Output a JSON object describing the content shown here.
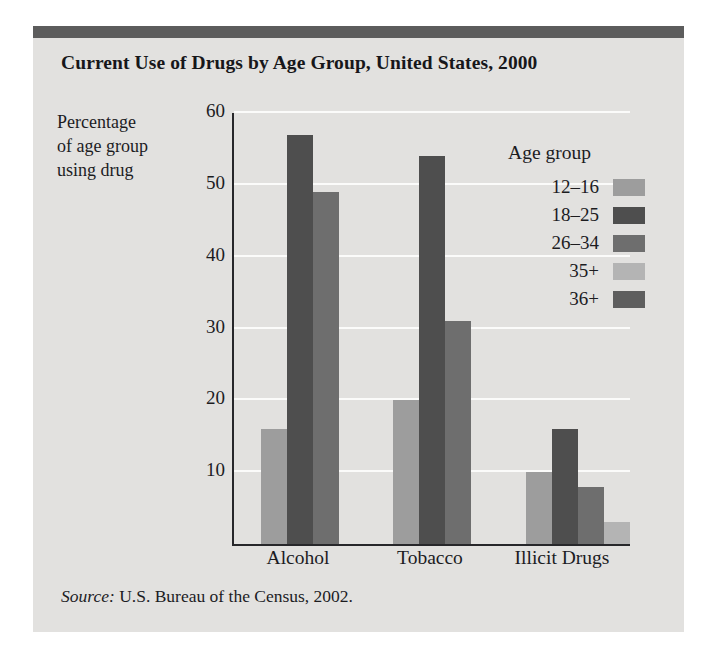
{
  "figure": {
    "title": "Current Use of Drugs by Age Group, United States, 2000",
    "ylabel_line1": "Percentage",
    "ylabel_line2": "of age group",
    "ylabel_line3": "using drug",
    "source_prefix": "Source:",
    "source_text": " U.S. Bureau of the Census, 2002.",
    "legend_title": "Age group",
    "panel_bg": "#e2e1df",
    "topbar_color": "#5c5c5c",
    "axis_color": "#27272a",
    "gridline_color": "#fbfbfa",
    "text_color": "#1c1c1f"
  },
  "chart_data": {
    "type": "bar",
    "title": "Current Use of Drugs by Age Group, United States, 2000",
    "xlabel": "",
    "ylabel": "Percentage of age group using drug",
    "ylim": [
      0,
      60
    ],
    "yticks": [
      10,
      20,
      30,
      40,
      50,
      60
    ],
    "ytick_labels": [
      "10",
      "20",
      "30",
      "40",
      "50",
      "60"
    ],
    "grid": true,
    "grid_axis": "y",
    "legend_position": "inside-upper-right",
    "legend_title": "Age group",
    "categories": [
      "Alcohol",
      "Tobacco",
      "Illicit Drugs"
    ],
    "series": [
      {
        "name": "12–16",
        "color": "#9d9d9d",
        "values": [
          16,
          20,
          10
        ]
      },
      {
        "name": "18–25",
        "color": "#4e4e4e",
        "values": [
          57,
          54,
          16
        ]
      },
      {
        "name": "26–34",
        "color": "#6e6e6e",
        "values": [
          49,
          31,
          8
        ]
      },
      {
        "name": "35+",
        "color": "#b4b4b4",
        "values": [
          null,
          null,
          3
        ]
      },
      {
        "name": "36+",
        "color": "#5e5e5e",
        "values": [
          null,
          null,
          null
        ]
      }
    ],
    "source": "Source: U.S. Bureau of the Census, 2002."
  },
  "legend": {
    "items": [
      {
        "label": "12–16",
        "color": "#9d9d9d"
      },
      {
        "label": "18–25",
        "color": "#4e4e4e"
      },
      {
        "label": "26–34",
        "color": "#6e6e6e"
      },
      {
        "label": "35+",
        "color": "#b4b4b4"
      },
      {
        "label": "36+",
        "color": "#5e5e5e"
      }
    ]
  }
}
